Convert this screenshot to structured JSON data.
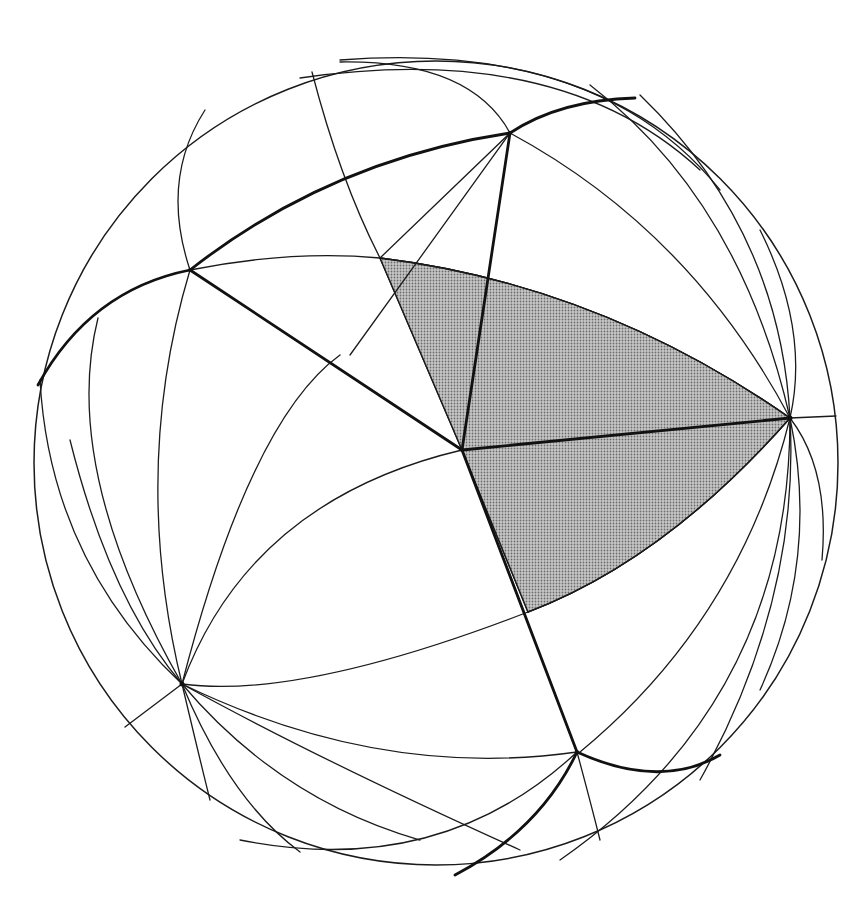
{
  "figure": {
    "colors": {
      "background": "#ffffff",
      "line": "#1a1a1a",
      "shaded_region": "#a9a9a9"
    },
    "elements": {
      "sphere": "outer-sphere-outline",
      "shaded_region": "shaded-spherical-triangle",
      "poles": [
        "right-pole-vertex",
        "lower-left-pole-vertex"
      ],
      "vertices": [
        "top-vertex",
        "upper-left-vertex",
        "center-vertex",
        "lower-vertex"
      ]
    }
  }
}
